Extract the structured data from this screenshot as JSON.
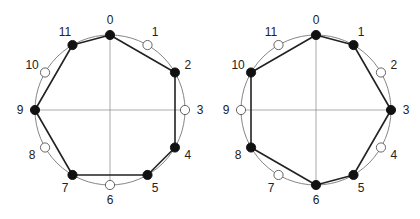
{
  "diagrams": [
    {
      "name": "left-clock",
      "center": [
        110,
        110
      ],
      "radius": 75,
      "labels": [
        "0",
        "1",
        "2",
        "3",
        "4",
        "5",
        "6",
        "7",
        "8",
        "9",
        "10",
        "11"
      ],
      "filled": [
        0,
        2,
        4,
        5,
        7,
        9,
        11
      ],
      "polygon": [
        0,
        2,
        4,
        5,
        7,
        9,
        11
      ]
    },
    {
      "name": "right-clock",
      "center": [
        316,
        110
      ],
      "radius": 75,
      "labels": [
        "0",
        "1",
        "2",
        "3",
        "4",
        "5",
        "6",
        "7",
        "8",
        "9",
        "10",
        "11"
      ],
      "filled": [
        0,
        1,
        3,
        5,
        6,
        8,
        10
      ],
      "polygon": [
        0,
        1,
        3,
        5,
        6,
        8,
        10
      ]
    }
  ],
  "colors": {
    "circle": "#777777",
    "axes": "#888888",
    "edge": "#222222",
    "filled_node": "#111111",
    "open_node_fill": "#ffffff",
    "open_node_stroke": "#555555"
  }
}
